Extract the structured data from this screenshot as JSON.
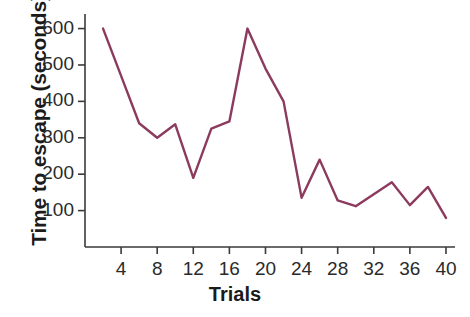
{
  "chart_data": {
    "type": "line",
    "title": "",
    "xlabel": "Trials",
    "ylabel": "Time to escape (seconds)",
    "xlim": [
      0,
      41
    ],
    "ylim": [
      0,
      640
    ],
    "grid": false,
    "legend": null,
    "line_color": "#8c3a5e",
    "line_width": 2.4,
    "xticks": [
      4,
      8,
      12,
      16,
      20,
      24,
      28,
      32,
      36,
      40
    ],
    "xtick_labels": [
      "4",
      "8",
      "12",
      "16",
      "20",
      "24",
      "28",
      "32",
      "36",
      "40"
    ],
    "yticks": [
      100,
      200,
      300,
      400,
      500,
      600
    ],
    "ytick_labels": [
      "100",
      "200",
      "300",
      "400",
      "500",
      "600"
    ],
    "x": [
      2,
      4,
      6,
      8,
      10,
      12,
      14,
      16,
      18,
      20,
      22,
      24,
      26,
      28,
      30,
      32,
      34,
      36,
      38,
      40
    ],
    "values": [
      600,
      470,
      340,
      300,
      337,
      190,
      325,
      345,
      600,
      490,
      400,
      135,
      240,
      128,
      112,
      145,
      178,
      115,
      165,
      80
    ],
    "series": [
      {
        "name": "Time to escape",
        "x": [
          2,
          4,
          6,
          8,
          10,
          12,
          14,
          16,
          18,
          20,
          22,
          24,
          26,
          28,
          30,
          32,
          34,
          36,
          38,
          40
        ],
        "values": [
          600,
          470,
          340,
          300,
          337,
          190,
          325,
          345,
          600,
          490,
          400,
          135,
          240,
          128,
          112,
          145,
          178,
          115,
          165,
          80
        ]
      }
    ]
  },
  "axes": {
    "y_title": "Time to escape (seconds)",
    "x_title": "Trials"
  }
}
